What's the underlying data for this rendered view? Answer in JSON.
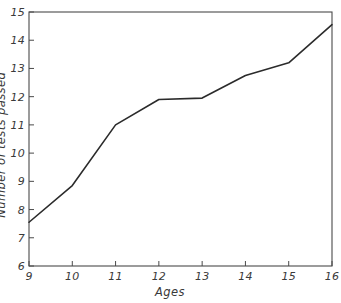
{
  "chart_data": {
    "type": "line",
    "title": "",
    "subtitle": "",
    "xlabel": "Ages",
    "ylabel": "Number of tests passed",
    "x": [
      9,
      10,
      11,
      12,
      13,
      14,
      15,
      16
    ],
    "values": [
      7.55,
      8.85,
      11.0,
      11.9,
      11.95,
      12.75,
      13.2,
      14.55
    ],
    "series": [
      {
        "name": "Number of tests passed",
        "values": [
          7.55,
          8.85,
          11.0,
          11.9,
          11.95,
          12.75,
          13.2,
          14.55
        ]
      }
    ],
    "xlim": [
      9,
      16
    ],
    "ylim": [
      6,
      15
    ],
    "xticks": [
      9,
      10,
      11,
      12,
      13,
      14,
      15,
      16
    ],
    "yticks": [
      6,
      7,
      8,
      9,
      10,
      11,
      12,
      13,
      14,
      15
    ],
    "xtick_labels": [
      "9",
      "10",
      "11",
      "12",
      "13",
      "14",
      "15",
      "16"
    ],
    "ytick_labels": [
      "6",
      "7",
      "8",
      "9",
      "10",
      "11",
      "12",
      "13",
      "14",
      "15"
    ],
    "grid": false,
    "legend": false,
    "legend_position": "none",
    "annotations": [],
    "line_color": "#2b2b2b",
    "axis_color": "#4a4a4a",
    "background_color": "#ffffff",
    "tick_direction": "in",
    "frame": "full"
  },
  "axes": {
    "x_title": "Ages",
    "y_title": "Number of tests passed"
  }
}
